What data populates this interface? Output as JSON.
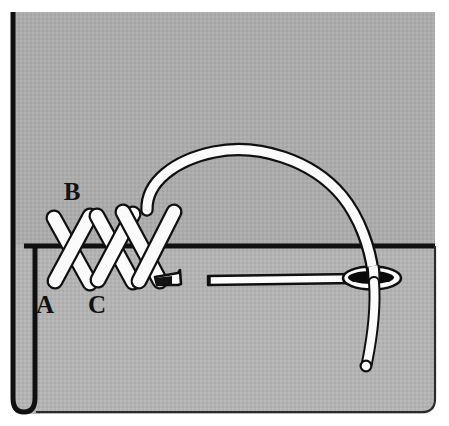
{
  "figure": {
    "domain": "medical-illustration",
    "width": 449,
    "height": 426,
    "background_color": "#ffffff"
  },
  "labels": [
    {
      "id": "label-b",
      "text": "B",
      "x": 72,
      "y": 200,
      "description": "entry point label above stitch row"
    },
    {
      "id": "label-a",
      "text": "A",
      "x": 45,
      "y": 313,
      "description": "lower left stitch label"
    },
    {
      "id": "label-c",
      "text": "C",
      "x": 97,
      "y": 313,
      "description": "second lower stitch label"
    }
  ],
  "tissue": {
    "upper_flap": {
      "name": "upper-tissue-flap",
      "color": "#ababab",
      "x": 11,
      "y": 12,
      "width": 424,
      "height": 234
    },
    "lower_flap": {
      "name": "lower-tissue-flap",
      "color": "#b3b3b3",
      "x": 11,
      "y": 245,
      "width": 424,
      "height": 169
    },
    "edge_color": "#101010",
    "edge_line_width": 5
  },
  "stitches": {
    "name": "cross-stitch-row",
    "thread_fill": "#fbfbfb",
    "thread_outline": "#101010",
    "count": 3,
    "bar_width": 13,
    "items": [
      {
        "id": "stitch-1",
        "x1": 53,
        "y1": 216,
        "x2": 88,
        "y2": 281
      },
      {
        "id": "stitch-2",
        "x1": 88,
        "y1": 216,
        "x2": 53,
        "y2": 281
      },
      {
        "id": "stitch-3",
        "x1": 97,
        "y1": 214,
        "x2": 132,
        "y2": 281
      },
      {
        "id": "stitch-4",
        "x1": 132,
        "y1": 214,
        "x2": 97,
        "y2": 281
      },
      {
        "id": "stitch-5",
        "x1": 134,
        "y1": 213,
        "x2": 169,
        "y2": 281
      },
      {
        "id": "stitch-6",
        "x1": 174,
        "y1": 212,
        "x2": 139,
        "y2": 281
      }
    ]
  },
  "suture_thread": {
    "name": "suture-thread-arc",
    "fill": "#fbfbfb",
    "outline": "#101010",
    "stroke_width": 9,
    "free_end": {
      "x": 148,
      "y": 207,
      "style": "rounded-cap"
    },
    "tail_end": {
      "x": 366,
      "y": 366,
      "style": "rounded-cap"
    },
    "arc_apex": {
      "x": 260,
      "y": 155
    }
  },
  "needle": {
    "name": "surgical-needle",
    "fill": "#fdfdfd",
    "outline": "#101010",
    "eye_fill": "#0a0a0a",
    "tip": {
      "x": 157,
      "y": 283,
      "label": "needle-point"
    },
    "shaft": {
      "x1": 207,
      "y1": 281,
      "x2": 352,
      "y2": 279
    },
    "eye": {
      "cx": 372,
      "cy": 278,
      "rx": 28,
      "ry": 10
    }
  },
  "colors": {
    "background": "#ffffff",
    "upper_tissue": "#ababab",
    "lower_tissue": "#b3b3b3",
    "ink": "#101010",
    "highlight": "#fbfbfb"
  }
}
